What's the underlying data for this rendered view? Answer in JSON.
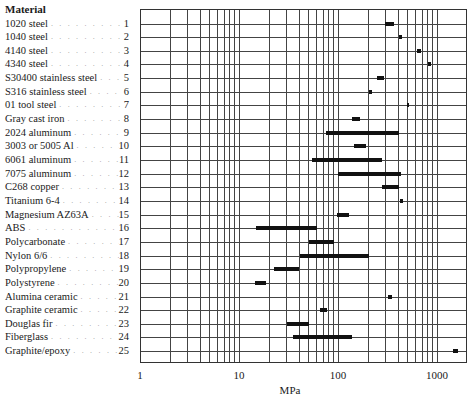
{
  "header": {
    "title": "Material"
  },
  "axis": {
    "xlabel": "MPa",
    "ticks": [
      "1",
      "10",
      "100",
      "1000"
    ]
  },
  "chart_data": {
    "type": "bar",
    "subtype": "horizontal range bar (floating), log x-axis",
    "title": "",
    "xlabel": "MPa",
    "ylabel": "Material",
    "xscale": "log",
    "xlim": [
      1,
      2000
    ],
    "xticks": [
      1,
      10,
      100,
      1000
    ],
    "grid": true,
    "legend": null,
    "categories": [
      "1020 steel",
      "1040 steel",
      "4140 steel",
      "4340 steel",
      "S30400 stainless steel",
      "S316 stainless steel",
      "01 tool steel",
      "Gray cast iron",
      "2024 aluminum",
      "3003 or 5005 Al",
      "6061 aluminum",
      "7075 aluminum",
      "C268 copper",
      "Titanium 6-4",
      "Magnesium AZ63A",
      "ABS",
      "Polycarbonate",
      "Nylon 6/6",
      "Polypropylene",
      "Polystyrene",
      "Alumina ceramic",
      "Graphite ceramic",
      "Douglas fir",
      "Fiberglass",
      "Graphite/epoxy"
    ],
    "numbers": [
      1,
      2,
      3,
      4,
      5,
      6,
      7,
      8,
      9,
      10,
      11,
      12,
      13,
      14,
      15,
      16,
      17,
      18,
      19,
      20,
      21,
      22,
      23,
      24,
      25
    ],
    "ranges": [
      [
        300,
        370
      ],
      [
        410,
        440
      ],
      [
        630,
        690
      ],
      [
        810,
        870
      ],
      [
        250,
        290
      ],
      [
        205,
        220
      ],
      [
        495,
        510
      ],
      [
        140,
        165
      ],
      [
        76,
        415
      ],
      [
        145,
        190
      ],
      [
        55,
        280
      ],
      [
        100,
        430
      ],
      [
        280,
        415
      ],
      [
        420,
        450
      ],
      [
        98,
        130
      ],
      [
        15,
        62
      ],
      [
        51,
        91
      ],
      [
        41,
        207
      ],
      [
        22.5,
        40
      ],
      [
        14.5,
        18.8
      ],
      [
        320,
        350
      ],
      [
        66,
        77
      ],
      [
        30.5,
        51
      ],
      [
        35,
        140
      ],
      [
        1450,
        1620
      ]
    ]
  },
  "rows": [
    {
      "name": "1020 steel",
      "num": "1"
    },
    {
      "name": "1040 steel",
      "num": "2"
    },
    {
      "name": "4140 steel",
      "num": "3"
    },
    {
      "name": "4340 steel",
      "num": "4"
    },
    {
      "name": "S30400 stainless steel",
      "num": "5"
    },
    {
      "name": "S316 stainless steel",
      "num": "6"
    },
    {
      "name": "01 tool steel",
      "num": "7"
    },
    {
      "name": "Gray cast iron",
      "num": "8"
    },
    {
      "name": "2024 aluminum",
      "num": "9"
    },
    {
      "name": "3003 or 5005 Al",
      "num": "10"
    },
    {
      "name": "6061 aluminum",
      "num": "11"
    },
    {
      "name": "7075 aluminum",
      "num": "12"
    },
    {
      "name": "C268 copper",
      "num": "13"
    },
    {
      "name": "Titanium 6-4",
      "num": "14"
    },
    {
      "name": "Magnesium AZ63A",
      "num": "15"
    },
    {
      "name": "ABS",
      "num": "16"
    },
    {
      "name": "Polycarbonate",
      "num": "17"
    },
    {
      "name": "Nylon 6/6",
      "num": "18"
    },
    {
      "name": "Polypropylene",
      "num": "19"
    },
    {
      "name": "Polystyrene",
      "num": "20"
    },
    {
      "name": "Alumina ceramic",
      "num": "21"
    },
    {
      "name": "Graphite ceramic",
      "num": "22"
    },
    {
      "name": "Douglas fir",
      "num": "23"
    },
    {
      "name": "Fiberglass",
      "num": "24"
    },
    {
      "name": "Graphite/epoxy",
      "num": "25"
    }
  ],
  "dots": ". . . . . . . . . . . . . . . . . . . . ."
}
